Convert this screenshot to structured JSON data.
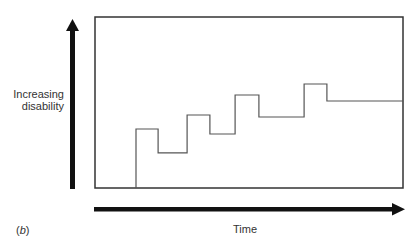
{
  "chart_data": {
    "type": "line",
    "subtype": "step",
    "title": "",
    "panel_label": "(b)",
    "xlabel": "Time",
    "ylabel": "Increasing disability",
    "ylabel_lines": [
      "Increasing",
      "disability"
    ],
    "xlim": [
      0,
      100
    ],
    "ylim": [
      0,
      100
    ],
    "grid": false,
    "legend": null,
    "axes_style": "arrows (no ticks), plot area boxed",
    "series": [
      {
        "name": "disability",
        "color": "#555555",
        "points": [
          [
            13.3,
            0
          ],
          [
            13.3,
            34.5
          ],
          [
            20.5,
            34.5
          ],
          [
            20.5,
            20.5
          ],
          [
            29.9,
            20.5
          ],
          [
            29.9,
            42.7
          ],
          [
            37.3,
            42.7
          ],
          [
            37.3,
            31.6
          ],
          [
            45.5,
            31.6
          ],
          [
            45.5,
            54.4
          ],
          [
            53.2,
            54.4
          ],
          [
            53.2,
            41.5
          ],
          [
            67.9,
            41.5
          ],
          [
            67.9,
            60.8
          ],
          [
            75.3,
            60.8
          ],
          [
            75.3,
            50.9
          ],
          [
            100,
            50.9
          ]
        ]
      }
    ]
  },
  "labels": {
    "y_line1": "Increasing",
    "y_line2": "disability",
    "x": "Time",
    "panel_open": "(",
    "panel_letter": "b",
    "panel_close": ")"
  },
  "colors": {
    "frame": "#333333",
    "line": "#555555",
    "arrow": "#111111"
  }
}
